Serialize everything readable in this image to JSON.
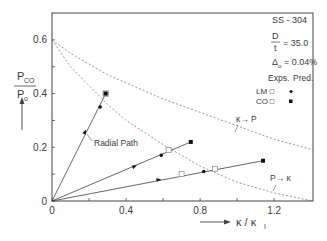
{
  "chart_data": {
    "type": "line",
    "title": "",
    "xlabel": "κ / κ_I",
    "ylabel": "P_CO / P_o",
    "xlim": [
      0,
      1.41
    ],
    "ylim": [
      0,
      0.7
    ],
    "grid": false,
    "x_ticks": [
      {
        "value": 0,
        "label": "0"
      },
      {
        "value": 0.2,
        "label": ""
      },
      {
        "value": 0.4,
        "label": "0.4"
      },
      {
        "value": 0.6,
        "label": ""
      },
      {
        "value": 0.8,
        "label": "0.8"
      },
      {
        "value": 1.0,
        "label": ""
      },
      {
        "value": 1.2,
        "label": "1.2"
      }
    ],
    "y_ticks": [
      {
        "value": 0,
        "label": "0"
      },
      {
        "value": 0.1,
        "label": ""
      },
      {
        "value": 0.2,
        "label": "0.2"
      },
      {
        "value": 0.3,
        "label": ""
      },
      {
        "value": 0.4,
        "label": "0.4"
      },
      {
        "value": 0.5,
        "label": ""
      },
      {
        "value": 0.6,
        "label": "0.6"
      }
    ],
    "info_box": {
      "material": "SS - 304",
      "d_over_t_num": "D",
      "d_over_t_den": "t",
      "d_over_t_value": "= 35.0",
      "delta_symbol": "Δ",
      "delta_sub": "o",
      "delta_value": "= 0.04%"
    },
    "legend": {
      "col_exps": "Exps.",
      "col_pred": "Pred.",
      "rows": [
        {
          "label": "LM",
          "exp_marker": "open-square",
          "pred_marker": "filled-circle"
        },
        {
          "label": "CO",
          "exp_marker": "open-square",
          "pred_marker": "filled-square"
        }
      ],
      "position": "upper right"
    },
    "annotations": [
      {
        "text": "Radial Path",
        "x": 0.35,
        "y": 0.16
      },
      {
        "text": "κ→ P",
        "x": 1.06,
        "y": 0.29
      },
      {
        "text": "P→ κ",
        "x": 1.18,
        "y": 0.09
      }
    ],
    "series": [
      {
        "name": "κ→P boundary (dashed)",
        "style": "dashed",
        "x": [
          0,
          0.1,
          0.2,
          0.3,
          0.4,
          0.6,
          0.8,
          1.0,
          1.2,
          1.41
        ],
        "y": [
          0.6,
          0.55,
          0.51,
          0.47,
          0.44,
          0.38,
          0.33,
          0.28,
          0.23,
          0.19
        ]
      },
      {
        "name": "P→κ boundary (dashed)",
        "style": "dashed",
        "x": [
          0,
          0.1,
          0.2,
          0.3,
          0.4,
          0.6,
          0.8,
          1.0,
          1.2,
          1.41
        ],
        "y": [
          0.6,
          0.5,
          0.43,
          0.36,
          0.3,
          0.21,
          0.13,
          0.07,
          0.03,
          0.0
        ]
      },
      {
        "name": "Radial path 1",
        "style": "solid",
        "x": [
          0,
          0.29
        ],
        "y": [
          0,
          0.4
        ],
        "arrow_at": {
          "x": 0.18,
          "y": 0.26
        },
        "points": [
          {
            "type": "LM-pred",
            "marker": "filled-circle",
            "x": 0.26,
            "y": 0.35
          },
          {
            "type": "LM-exp",
            "marker": "open-square",
            "x": 0.29,
            "y": 0.4
          },
          {
            "type": "CO-exp",
            "marker": "open-square",
            "x": 0.29,
            "y": 0.4
          },
          {
            "type": "CO-pred",
            "marker": "filled-square",
            "x": 0.29,
            "y": 0.4
          }
        ]
      },
      {
        "name": "Radial path 2",
        "style": "solid",
        "x": [
          0,
          0.75
        ],
        "y": [
          0,
          0.22
        ],
        "arrow_at": {
          "x": 0.45,
          "y": 0.13
        },
        "points": [
          {
            "type": "LM-pred",
            "marker": "filled-circle",
            "x": 0.59,
            "y": 0.17
          },
          {
            "type": "LM-exp",
            "marker": "open-square",
            "x": 0.63,
            "y": 0.19
          },
          {
            "type": "CO-pred",
            "marker": "filled-square",
            "x": 0.75,
            "y": 0.22
          }
        ]
      },
      {
        "name": "Radial path 3",
        "style": "solid",
        "x": [
          0,
          1.14
        ],
        "y": [
          0,
          0.15
        ],
        "arrow_at": {
          "x": 0.58,
          "y": 0.08
        },
        "points": [
          {
            "type": "LM-exp",
            "marker": "open-square",
            "x": 0.7,
            "y": 0.1
          },
          {
            "type": "LM-pred",
            "marker": "filled-circle",
            "x": 0.82,
            "y": 0.11
          },
          {
            "type": "CO-exp",
            "marker": "open-square",
            "x": 0.88,
            "y": 0.12
          },
          {
            "type": "CO-pred",
            "marker": "filled-square",
            "x": 1.14,
            "y": 0.15
          }
        ]
      }
    ]
  },
  "colors": {
    "axis": "#444444",
    "line": "#555555",
    "dashed": "#8a8a8a",
    "marker": "#111111",
    "text": "#3a3a3a"
  }
}
